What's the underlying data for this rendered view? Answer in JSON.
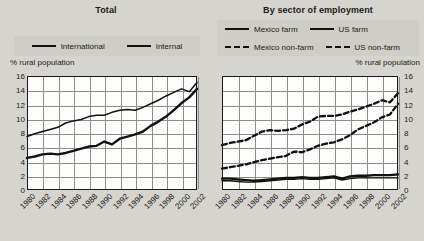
{
  "panels": {
    "left": {
      "title": "Total",
      "y_axis_title": "% rural population",
      "legend": [
        {
          "label": "International",
          "style": "solid-thin",
          "name": "legend-international"
        },
        {
          "label": "Internal",
          "style": "solid-thick",
          "name": "legend-internal"
        }
      ]
    },
    "right": {
      "title": "By sector of employment",
      "y_axis_title": "% rural population",
      "legend": [
        {
          "label": "Mexico farm",
          "style": "solid-thin",
          "name": "legend-mexico-farm"
        },
        {
          "label": "US farm",
          "style": "solid-thick",
          "name": "legend-us-farm"
        },
        {
          "label": "Mexico non-farm",
          "style": "dashed",
          "name": "legend-mexico-non-farm"
        },
        {
          "label": "US non-farm",
          "style": "dashed",
          "name": "legend-us-non-farm"
        }
      ]
    }
  },
  "chart_data": [
    {
      "type": "line",
      "title": "Total",
      "xlabel": "",
      "ylabel": "% rural population",
      "ylim": [
        0,
        16
      ],
      "yticks": [
        0,
        2,
        4,
        6,
        8,
        10,
        12,
        14,
        16
      ],
      "xticks": [
        "1980",
        "1982",
        "1984",
        "1986",
        "1988",
        "1990",
        "1992",
        "1994",
        "1996",
        "1998",
        "2000",
        "2002"
      ],
      "x": [
        1980,
        1981,
        1982,
        1983,
        1984,
        1985,
        1986,
        1987,
        1988,
        1989,
        1990,
        1991,
        1992,
        1993,
        1994,
        1995,
        1996,
        1997,
        1998,
        1999,
        2000,
        2001,
        2002
      ],
      "grid": true,
      "legend_position": "top",
      "series": [
        {
          "name": "International",
          "values": [
            7.5,
            7.9,
            8.2,
            8.5,
            8.8,
            9.4,
            9.7,
            9.9,
            10.3,
            10.5,
            10.5,
            10.9,
            11.2,
            11.3,
            11.2,
            11.6,
            12.1,
            12.6,
            13.2,
            13.7,
            14.2,
            13.8,
            15.1
          ]
        },
        {
          "name": "Internal",
          "values": [
            4.5,
            4.7,
            5.0,
            5.1,
            5.0,
            5.2,
            5.5,
            5.8,
            6.1,
            6.2,
            6.8,
            6.4,
            7.2,
            7.5,
            7.8,
            8.2,
            9.0,
            9.6,
            10.3,
            11.2,
            12.2,
            13.0,
            14.2
          ]
        }
      ]
    },
    {
      "type": "line",
      "title": "By sector of employment",
      "xlabel": "",
      "ylabel": "% rural population",
      "ylim": [
        0,
        16
      ],
      "yticks": [
        0,
        2,
        4,
        6,
        8,
        10,
        12,
        14,
        16
      ],
      "xticks": [
        "1980",
        "1982",
        "1984",
        "1986",
        "1988",
        "1990",
        "1992",
        "1994",
        "1996",
        "1998",
        "2000",
        "2002"
      ],
      "x": [
        1980,
        1981,
        1982,
        1983,
        1984,
        1985,
        1986,
        1987,
        1988,
        1989,
        1990,
        1991,
        1992,
        1993,
        1994,
        1995,
        1996,
        1997,
        1998,
        1999,
        2000,
        2001,
        2002
      ],
      "grid": true,
      "legend_position": "top",
      "series": [
        {
          "name": "Mexico non-farm",
          "values": [
            6.3,
            6.6,
            6.8,
            7.0,
            7.6,
            8.2,
            8.4,
            8.3,
            8.4,
            8.6,
            9.2,
            9.6,
            10.3,
            10.4,
            10.4,
            10.6,
            11.0,
            11.3,
            11.7,
            12.1,
            12.6,
            12.3,
            13.6
          ]
        },
        {
          "name": "US non-farm",
          "values": [
            3.0,
            3.2,
            3.4,
            3.6,
            3.9,
            4.2,
            4.4,
            4.6,
            4.8,
            5.4,
            5.3,
            5.7,
            6.2,
            6.5,
            6.7,
            7.1,
            7.7,
            8.5,
            9.0,
            9.5,
            10.2,
            10.6,
            12.1
          ]
        },
        {
          "name": "US farm",
          "values": [
            1.6,
            1.6,
            1.5,
            1.4,
            1.3,
            1.4,
            1.5,
            1.6,
            1.7,
            1.7,
            1.8,
            1.7,
            1.7,
            1.8,
            1.9,
            1.6,
            1.9,
            2.0,
            2.0,
            2.1,
            2.1,
            2.1,
            2.2
          ]
        },
        {
          "name": "Mexico farm",
          "values": [
            1.3,
            1.3,
            1.2,
            1.1,
            1.1,
            1.2,
            1.3,
            1.4,
            1.5,
            1.5,
            1.6,
            1.5,
            1.5,
            1.6,
            1.7,
            1.4,
            1.6,
            1.7,
            1.7,
            1.7,
            1.7,
            1.7,
            1.7
          ]
        }
      ]
    }
  ]
}
